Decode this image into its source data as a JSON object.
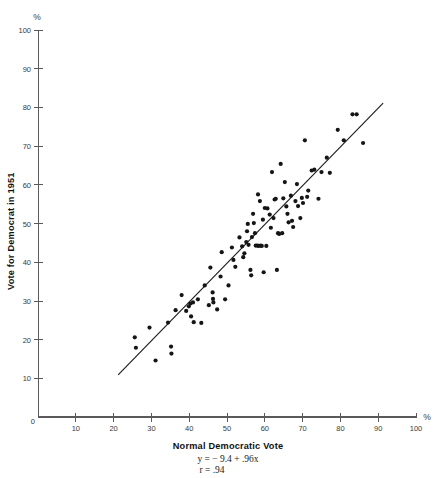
{
  "chart_data": {
    "type": "scatter",
    "title": "",
    "xlabel": "Normal Democratic Vote",
    "ylabel": "Vote for Democrat in 1951",
    "x_unit_label": "%",
    "y_unit_label": "%",
    "xlim": [
      0,
      100
    ],
    "ylim": [
      0,
      100
    ],
    "xticks": [
      0,
      10,
      20,
      30,
      40,
      50,
      60,
      70,
      80,
      90,
      100
    ],
    "yticks": [
      0,
      10,
      20,
      30,
      40,
      50,
      60,
      70,
      80,
      90,
      100
    ],
    "xticklabels": [
      "0",
      "10",
      "20",
      "30",
      "40",
      "50",
      "60",
      "70",
      "80",
      "90",
      "100"
    ],
    "yticklabels": [
      "0",
      "10",
      "20",
      "30",
      "40",
      "50",
      "60",
      "70",
      "80",
      "90",
      "100"
    ],
    "grid": false,
    "legend": false,
    "annotations": [
      "y = − 9.4 + .96x",
      "r = .94"
    ],
    "regression": {
      "intercept": -9.4,
      "slope": 0.96,
      "r": 0.94,
      "x_start": 21.2,
      "x_end": 91.3,
      "y_start": 10.9,
      "y_end": 81.1
    },
    "points": [
      [
        25.6,
        20.6
      ],
      [
        25.9,
        17.9
      ],
      [
        29.5,
        23.1
      ],
      [
        31.1,
        14.6
      ],
      [
        34.4,
        24.4
      ],
      [
        35.2,
        18.2
      ],
      [
        35.3,
        16.4
      ],
      [
        36.4,
        27.6
      ],
      [
        38.0,
        31.5
      ],
      [
        39.2,
        27.4
      ],
      [
        39.9,
        28.6
      ],
      [
        40.3,
        29.3
      ],
      [
        40.5,
        26.0
      ],
      [
        41.0,
        29.6
      ],
      [
        41.2,
        24.5
      ],
      [
        42.3,
        30.4
      ],
      [
        43.2,
        24.3
      ],
      [
        44.1,
        34.0
      ],
      [
        45.2,
        28.9
      ],
      [
        45.6,
        38.6
      ],
      [
        46.2,
        32.2
      ],
      [
        46.3,
        30.5
      ],
      [
        46.4,
        29.6
      ],
      [
        47.4,
        27.8
      ],
      [
        48.3,
        36.3
      ],
      [
        48.6,
        42.6
      ],
      [
        49.5,
        30.4
      ],
      [
        50.4,
        34.0
      ],
      [
        51.3,
        43.8
      ],
      [
        51.7,
        40.6
      ],
      [
        52.2,
        38.8
      ],
      [
        53.3,
        46.4
      ],
      [
        54.0,
        44.1
      ],
      [
        54.3,
        41.3
      ],
      [
        54.6,
        42.3
      ],
      [
        55.1,
        45.2
      ],
      [
        55.3,
        48.0
      ],
      [
        55.5,
        49.9
      ],
      [
        55.7,
        44.5
      ],
      [
        56.2,
        38.0
      ],
      [
        56.4,
        36.6
      ],
      [
        56.6,
        46.5
      ],
      [
        56.9,
        52.5
      ],
      [
        57.1,
        50.1
      ],
      [
        57.4,
        47.5
      ],
      [
        57.6,
        44.3
      ],
      [
        58.0,
        44.3
      ],
      [
        58.2,
        57.5
      ],
      [
        58.4,
        44.2
      ],
      [
        58.7,
        55.8
      ],
      [
        58.9,
        44.3
      ],
      [
        59.2,
        44.2
      ],
      [
        59.5,
        51.0
      ],
      [
        59.7,
        37.4
      ],
      [
        60.0,
        54.0
      ],
      [
        60.4,
        44.2
      ],
      [
        60.7,
        53.9
      ],
      [
        61.3,
        52.3
      ],
      [
        61.6,
        48.9
      ],
      [
        61.9,
        63.3
      ],
      [
        62.3,
        51.4
      ],
      [
        62.6,
        56.2
      ],
      [
        62.9,
        56.4
      ],
      [
        63.2,
        38.0
      ],
      [
        63.5,
        47.5
      ],
      [
        63.8,
        47.3
      ],
      [
        64.2,
        65.4
      ],
      [
        64.6,
        47.5
      ],
      [
        64.9,
        56.5
      ],
      [
        65.3,
        60.7
      ],
      [
        65.7,
        54.4
      ],
      [
        66.0,
        52.5
      ],
      [
        66.3,
        50.3
      ],
      [
        66.9,
        57.2
      ],
      [
        67.2,
        50.7
      ],
      [
        67.5,
        49.1
      ],
      [
        68.1,
        55.8
      ],
      [
        68.5,
        60.2
      ],
      [
        68.8,
        54.5
      ],
      [
        69.4,
        51.4
      ],
      [
        69.8,
        56.6
      ],
      [
        70.1,
        55.3
      ],
      [
        70.6,
        71.5
      ],
      [
        71.2,
        56.9
      ],
      [
        71.5,
        58.5
      ],
      [
        72.4,
        63.7
      ],
      [
        73.1,
        63.9
      ],
      [
        74.2,
        56.4
      ],
      [
        75.0,
        63.3
      ],
      [
        76.4,
        67.0
      ],
      [
        77.2,
        63.1
      ],
      [
        79.3,
        74.2
      ],
      [
        80.9,
        71.5
      ],
      [
        83.2,
        78.2
      ],
      [
        84.3,
        78.2
      ],
      [
        86.0,
        70.8
      ]
    ]
  }
}
